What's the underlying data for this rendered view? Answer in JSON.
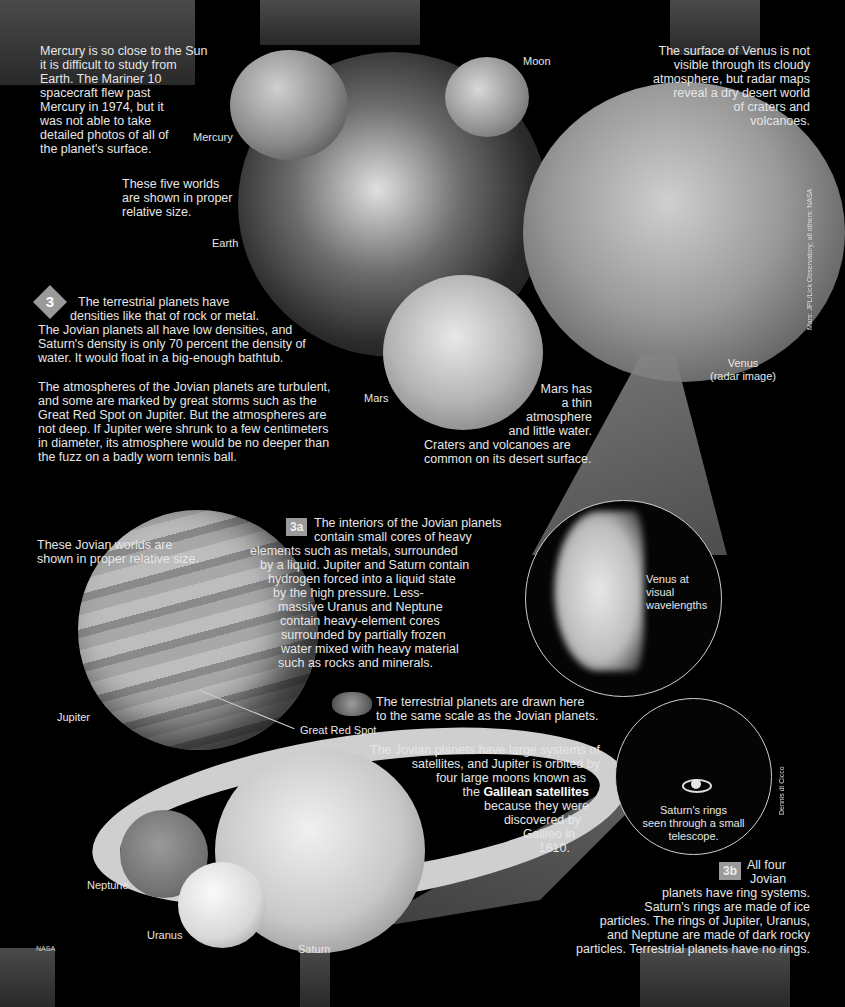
{
  "mercury_text": {
    "lines": [
      "Mercury is so close to the Sun",
      "it is difficult to study from",
      "Earth. The Mariner 10",
      "spacecraft flew past",
      "Mercury in 1974, but it",
      "was not able to take",
      "detailed photos of all of",
      "the planet's surface."
    ]
  },
  "five_worlds_note": {
    "lines": [
      "These five worlds",
      "are shown in proper",
      "relative size."
    ]
  },
  "venus_text": {
    "lines": [
      "The surface of Venus is not",
      "visible through its cloudy",
      "atmosphere, but radar maps",
      "reveal a dry desert world",
      "of craters and",
      "volcanoes."
    ]
  },
  "labels": {
    "mercury": "Mercury",
    "moon": "Moon",
    "earth": "Earth",
    "mars": "Mars",
    "venus_radar_1": "Venus",
    "venus_radar_2": "(radar image)",
    "jupiter": "Jupiter",
    "great_red_spot": "Great Red Spot",
    "neptune": "Neptune",
    "uranus": "Uranus",
    "saturn": "Saturn",
    "nasa_credit": "NASA",
    "venus_credit": "Mars: JPL/Lick Observatory; all others: NASA",
    "saturn_credit": "Dennis di Cicco"
  },
  "section3": {
    "badge": "3",
    "para1_lines": [
      "The terrestrial planets have",
      "densities like that of rock or metal.",
      "The Jovian planets all have low densities, and",
      "Saturn's density is only 70 percent the density of",
      "water. It would float in a big-enough bathtub."
    ],
    "para2_lines": [
      "The atmospheres of the Jovian planets are turbulent,",
      "and some are marked by great storms such as the",
      "Great Red Spot on Jupiter. But the atmospheres are",
      "not deep. If Jupiter were shrunk to a few centimeters",
      "in diameter, its atmosphere would be no deeper than",
      "the fuzz on a badly worn tennis ball."
    ]
  },
  "mars_text": {
    "lines": [
      "Mars has",
      "a thin",
      "atmosphere",
      "and little water."
    ],
    "lines2": [
      "Craters and volcanoes are",
      "common on its desert surface."
    ]
  },
  "venus_visual": {
    "lines": [
      "Venus at",
      "visual",
      "wavelengths"
    ]
  },
  "jovian_note": {
    "lines": [
      "These Jovian worlds are",
      "shown in proper relative size."
    ]
  },
  "section3a": {
    "badge": "3a",
    "lines": [
      "The interiors of the Jovian planets",
      "contain small cores of heavy",
      "elements such as metals, surrounded",
      "by a liquid. Jupiter and Saturn contain",
      "hydrogen forced into a liquid state",
      "by the high pressure. Less-",
      "massive Uranus and Neptune",
      "contain heavy-element cores",
      "surrounded by partially frozen",
      "water mixed with heavy material",
      "such as rocks and minerals."
    ]
  },
  "scale_note": {
    "lines": [
      "The terrestrial planets are drawn here",
      "to the same scale as the Jovian planets."
    ]
  },
  "satellites_text": {
    "lines": [
      "The Jovian planets have large systems of",
      "satellites, and Jupiter is orbited by",
      "four large moons known as"
    ],
    "line4_prefix": "the ",
    "line4_bold": "Galilean satellites",
    "lines_after": [
      "because they were",
      "discovered by",
      "Galileo in",
      "1610."
    ]
  },
  "saturn_scope": {
    "lines": [
      "Saturn's rings",
      "seen through a small",
      "telescope."
    ]
  },
  "section3b": {
    "badge": "3b",
    "line1": "All four",
    "line2": "Jovian",
    "lines": [
      "planets have ring systems.",
      "Saturn's rings are made of ice",
      "particles. The rings of Jupiter, Uranus,",
      "and Neptune are made of dark rocky",
      "particles. Terrestrial planets have no rings."
    ]
  }
}
